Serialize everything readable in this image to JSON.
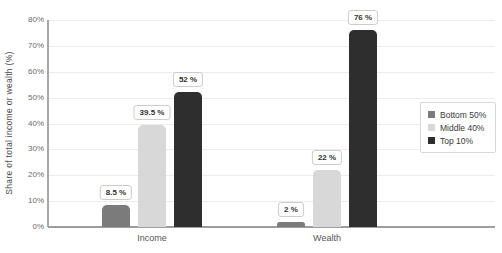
{
  "chart_data": {
    "type": "bar",
    "title": "",
    "categories": [
      "Income",
      "Wealth"
    ],
    "series": [
      {
        "name": "Bottom 50%",
        "color": "#7b7b7b",
        "values": [
          8.5,
          2
        ],
        "data_labels": [
          "8.5 %",
          "2 %"
        ]
      },
      {
        "name": "Middle 40%",
        "color": "#d8d8d8",
        "values": [
          39.5,
          22
        ],
        "data_labels": [
          "39.5 %",
          "22 %"
        ]
      },
      {
        "name": "Top 10%",
        "color": "#2e2e2e",
        "values": [
          52,
          76
        ],
        "data_labels": [
          "52 %",
          "76 %"
        ]
      }
    ],
    "xlabel": "",
    "ylabel": "Share of total income or wealth (%)",
    "ylim": [
      0,
      80
    ],
    "yticks": [
      "0%",
      "10%",
      "20%",
      "30%",
      "40%",
      "50%",
      "60%",
      "70%",
      "80%"
    ],
    "ytick_values": [
      0,
      10,
      20,
      30,
      40,
      50,
      60,
      70,
      80
    ],
    "grid": true,
    "legend_position": "middle-right"
  },
  "colors": {
    "background": "#ffffff",
    "gridline": "#ececec",
    "axis": "#9e9e9e",
    "tick_text": "#6a6a6a",
    "category_text": "#555555",
    "data_label_text": "#333333"
  }
}
